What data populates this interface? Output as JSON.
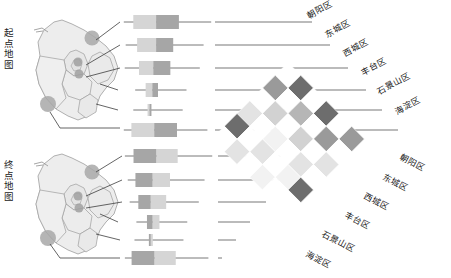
{
  "figure": {
    "type": "matrix-with-boxplots",
    "title": "",
    "background": "#ffffff"
  },
  "axis_captions": {
    "origin": "起点地图",
    "destination": "终点地图"
  },
  "districts": [
    "朝阳区",
    "东城区",
    "西城区",
    "丰台区",
    "石景山区",
    "海淀区"
  ],
  "labels": {
    "top_right": [
      "朝阳区",
      "东城区",
      "西城区",
      "丰台区",
      "石景山区",
      "海淀区"
    ],
    "bottom_right": [
      "朝阳区",
      "东城区",
      "西城区",
      "丰台区",
      "石景山区",
      "海淀区"
    ]
  },
  "colors": {
    "level_0": "#ffffff",
    "level_1": "#f2f2f2",
    "level_2": "#e3e3e3",
    "level_3": "#d2d2d2",
    "level_4": "#b6b6b6",
    "level_5": "#9a9a9a",
    "level_6": "#6d6d6d",
    "cell_stroke": "#ffffff",
    "box_light": "#d5d5d5",
    "box_dark": "#a6a6a6",
    "whisker": "#555555",
    "map_fill": "#ededed",
    "map_stroke": "#9d9d9d",
    "marker": "#9e9e9e",
    "leader": "#444444",
    "text": "#1c1c1c"
  },
  "chart_data": {
    "type": "heatmap",
    "xlabel": "终点区",
    "ylabel": "起点区",
    "categories": [
      "朝阳区",
      "东城区",
      "西城区",
      "丰台区",
      "石景山区",
      "海淀区"
    ],
    "x": [
      "朝阳区",
      "东城区",
      "西城区",
      "丰台区",
      "石景山区",
      "海淀区"
    ],
    "y": [
      "朝阳区",
      "东城区",
      "西城区",
      "丰台区",
      "石景山区",
      "海淀区"
    ],
    "grid": false,
    "legend": "none",
    "zlim": [
      0,
      6
    ],
    "values": [
      [
        0,
        6,
        0,
        6,
        0,
        5
      ],
      [
        5,
        0,
        4,
        0,
        5,
        0
      ],
      [
        0,
        3,
        0,
        3,
        0,
        2
      ],
      [
        2,
        0,
        1,
        0,
        2,
        0
      ],
      [
        6,
        0,
        2,
        0,
        1,
        6
      ],
      [
        0,
        2,
        0,
        1,
        0,
        0
      ]
    ],
    "note": "Darker cells indicate higher origin–destination flow volume; diagonal-band pattern alternates light/dark."
  },
  "boxplots": {
    "axis_range": [
      0,
      100
    ],
    "origin_title": "起点地图分布",
    "destination_title": "终点地图分布",
    "origin": [
      {
        "district": "朝阳区",
        "min": 4,
        "q1": 14,
        "median": 38,
        "q3": 62,
        "max": 96,
        "shade_left": "light",
        "shade_right": "dark"
      },
      {
        "district": "东城区",
        "min": 6,
        "q1": 18,
        "median": 38,
        "q3": 56,
        "max": 88,
        "shade_left": "light",
        "shade_right": "dark"
      },
      {
        "district": "西城区",
        "min": 5,
        "q1": 20,
        "median": 35,
        "q3": 53,
        "max": 84,
        "shade_left": "light",
        "shade_right": "dark"
      },
      {
        "district": "丰台区",
        "min": 16,
        "q1": 27,
        "median": 34,
        "q3": 40,
        "max": 70,
        "shade_left": "light",
        "shade_right": "dark"
      },
      {
        "district": "石景山区",
        "min": 14,
        "q1": 29,
        "median": 31,
        "q3": 33,
        "max": 66,
        "shade_left": "light",
        "shade_right": "dark"
      },
      {
        "district": "海淀区",
        "min": 4,
        "q1": 12,
        "median": 36,
        "q3": 60,
        "max": 92,
        "shade_left": "light",
        "shade_right": "dark"
      }
    ],
    "destination": [
      {
        "district": "朝阳区",
        "min": 3,
        "q1": 12,
        "median": 36,
        "q3": 58,
        "max": 94,
        "shade_left": "dark",
        "shade_right": "light"
      },
      {
        "district": "东城区",
        "min": 6,
        "q1": 14,
        "median": 32,
        "q3": 50,
        "max": 86,
        "shade_left": "dark",
        "shade_right": "light"
      },
      {
        "district": "西城区",
        "min": 8,
        "q1": 17,
        "median": 30,
        "q3": 46,
        "max": 80,
        "shade_left": "dark",
        "shade_right": "light"
      },
      {
        "district": "丰台区",
        "min": 15,
        "q1": 26,
        "median": 32,
        "q3": 39,
        "max": 68,
        "shade_left": "dark",
        "shade_right": "light"
      },
      {
        "district": "石景山区",
        "min": 13,
        "q1": 28,
        "median": 30,
        "q3": 32,
        "max": 64,
        "shade_left": "dark",
        "shade_right": "light"
      },
      {
        "district": "海淀区",
        "min": 3,
        "q1": 10,
        "median": 34,
        "q3": 56,
        "max": 90,
        "shade_left": "dark",
        "shade_right": "light"
      }
    ]
  },
  "map_markers": {
    "origin": [
      {
        "district": "朝阳区",
        "size": "large"
      },
      {
        "district": "东城区",
        "size": "small"
      },
      {
        "district": "西城区",
        "size": "small"
      },
      {
        "district": "丰台区",
        "size": "none"
      },
      {
        "district": "石景山区",
        "size": "none"
      },
      {
        "district": "海淀区",
        "size": "large"
      }
    ],
    "destination": [
      {
        "district": "朝阳区",
        "size": "large"
      },
      {
        "district": "东城区",
        "size": "small"
      },
      {
        "district": "西城区",
        "size": "small"
      },
      {
        "district": "丰台区",
        "size": "none"
      },
      {
        "district": "石景山区",
        "size": "none"
      },
      {
        "district": "海淀区",
        "size": "large"
      }
    ]
  }
}
